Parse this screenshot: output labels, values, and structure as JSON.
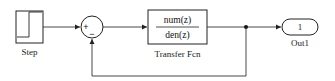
{
  "diagram": {
    "type": "simulink-block-diagram",
    "blocks": {
      "step": {
        "label": "Step"
      },
      "sum": {
        "signs": [
          "+",
          "−"
        ]
      },
      "transfer_fcn": {
        "numerator": "num(z)",
        "denominator": "den(z)",
        "label": "Transfer Fcn"
      },
      "outport": {
        "port_number": "1",
        "label": "Out1"
      }
    },
    "connections": [
      {
        "from": "Step",
        "to": "Sum (+)"
      },
      {
        "from": "Sum",
        "to": "Transfer Fcn"
      },
      {
        "from": "Transfer Fcn",
        "to": "Out1"
      },
      {
        "from": "Transfer Fcn output (branch)",
        "to": "Sum (−)",
        "kind": "feedback"
      }
    ],
    "colors": {
      "line": "#333333",
      "block_border": "#222222",
      "background": "#ffffff"
    }
  }
}
